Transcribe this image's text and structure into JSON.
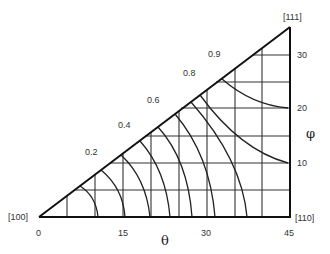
{
  "diagram": {
    "corners": {
      "origin": "[100]",
      "bottom_right": "[110]",
      "top_right": "[111]"
    },
    "x_axis": {
      "symbol": "θ",
      "ticks": [
        "0",
        "15",
        "30",
        "45"
      ]
    },
    "y_axis": {
      "symbol": "φ",
      "ticks": [
        "10",
        "20",
        "30"
      ]
    },
    "contour_labels": [
      "0.2",
      "0.4",
      "0.6",
      "0.8",
      "0.9"
    ],
    "colors": {
      "line": "#222222",
      "background": "#ffffff"
    }
  }
}
